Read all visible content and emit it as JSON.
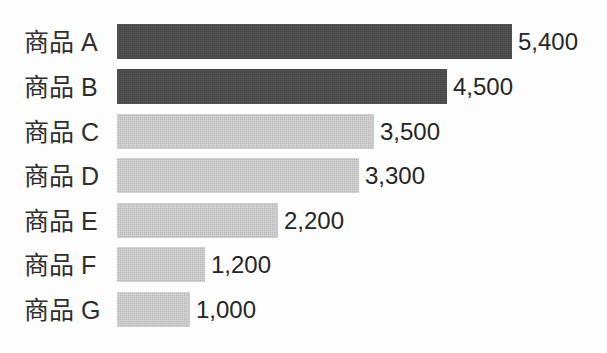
{
  "chart_data": {
    "type": "bar",
    "orientation": "horizontal",
    "title": "",
    "subtitle": "",
    "xlabel": "",
    "ylabel": "",
    "grid": false,
    "legend": "none",
    "axis_visible": false,
    "xlim": [
      0,
      5400
    ],
    "categories": [
      "商品 A",
      "商品 B",
      "商品 C",
      "商品 D",
      "商品 E",
      "商品 F",
      "商品 G"
    ],
    "values": [
      5400,
      4500,
      3500,
      3300,
      2200,
      1200,
      1000
    ],
    "value_labels": [
      "5,400",
      "4,500",
      "3,500",
      "3,300",
      "2,200",
      "1,200",
      "1,000"
    ],
    "bar_colors": [
      "#474747",
      "#474747",
      "#b9b9b9",
      "#b9b9b9",
      "#b9b9b9",
      "#b9b9b9",
      "#b9b9b9"
    ],
    "series": [
      {
        "name": "",
        "values": [
          5400,
          4500,
          3500,
          3300,
          2200,
          1200,
          1000
        ]
      }
    ]
  },
  "rows": [
    {
      "label": "商品 A",
      "value": 5400,
      "value_label": "5,400",
      "bar_px": 395,
      "top_px": 24,
      "tone": "dark"
    },
    {
      "label": "商品 B",
      "value": 4500,
      "value_label": "4,500",
      "bar_px": 330,
      "top_px": 69,
      "tone": "dark"
    },
    {
      "label": "商品 C",
      "value": 3500,
      "value_label": "3,500",
      "bar_px": 257,
      "top_px": 114,
      "tone": "light"
    },
    {
      "label": "商品 D",
      "value": 3300,
      "value_label": "3,300",
      "bar_px": 242,
      "top_px": 158,
      "tone": "light"
    },
    {
      "label": "商品 E",
      "value": 2200,
      "value_label": "2,200",
      "bar_px": 161,
      "top_px": 203,
      "tone": "light"
    },
    {
      "label": "商品 F",
      "value": 1200,
      "value_label": "1,200",
      "bar_px": 88,
      "top_px": 247,
      "tone": "light"
    },
    {
      "label": "商品 G",
      "value": 1000,
      "value_label": "1,000",
      "bar_px": 73,
      "top_px": 292,
      "tone": "light"
    }
  ],
  "colors": {
    "dark_bar": "#474747",
    "light_bar": "#b9b9b9",
    "label_text": "#2e2e2e",
    "value_text": "#262626",
    "background": "#fdfdfd"
  }
}
